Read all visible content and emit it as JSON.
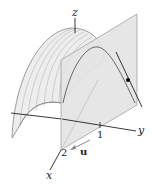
{
  "figure": {
    "labels": {
      "z_axis": "z",
      "y_axis": "y",
      "x_axis": "x",
      "y_tick": "1",
      "x_tick": "2",
      "vector": "u"
    },
    "colors": {
      "surface_fill": "#ececec",
      "plane_fill": "#e2e2e2",
      "lines": "#555555",
      "axes": "#222222",
      "point": "#000000"
    }
  }
}
